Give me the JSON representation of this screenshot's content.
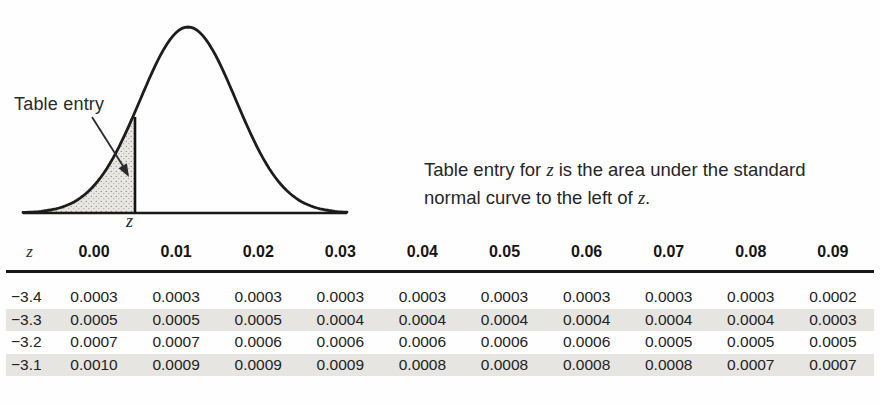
{
  "figure": {
    "annotation_label": "Table entry",
    "z_axis_label": "z"
  },
  "caption": {
    "line1": [
      "Table entry for ",
      "z",
      " is the area under the standard"
    ],
    "line2": [
      "normal curve to the left of ",
      "z",
      "."
    ]
  },
  "table": {
    "corner_header": "z",
    "column_headers": [
      "0.00",
      "0.01",
      "0.02",
      "0.03",
      "0.04",
      "0.05",
      "0.06",
      "0.07",
      "0.08",
      "0.09"
    ],
    "rows": [
      {
        "z": "−3.4",
        "shaded": false,
        "values": [
          "0.0003",
          "0.0003",
          "0.0003",
          "0.0003",
          "0.0003",
          "0.0003",
          "0.0003",
          "0.0003",
          "0.0003",
          "0.0002"
        ]
      },
      {
        "z": "−3.3",
        "shaded": true,
        "values": [
          "0.0005",
          "0.0005",
          "0.0005",
          "0.0004",
          "0.0004",
          "0.0004",
          "0.0004",
          "0.0004",
          "0.0004",
          "0.0003"
        ]
      },
      {
        "z": "−3.2",
        "shaded": false,
        "values": [
          "0.0007",
          "0.0007",
          "0.0006",
          "0.0006",
          "0.0006",
          "0.0006",
          "0.0006",
          "0.0005",
          "0.0005",
          "0.0005"
        ]
      },
      {
        "z": "−3.1",
        "shaded": true,
        "values": [
          "0.0010",
          "0.0009",
          "0.0009",
          "0.0009",
          "0.0008",
          "0.0008",
          "0.0008",
          "0.0008",
          "0.0007",
          "0.0007"
        ]
      }
    ]
  },
  "colors": {
    "row_shade": "#e6e5e1",
    "ink": "#1d1d1d",
    "tail_fill": "#e9e7e2",
    "stipple_dot": "#92908a"
  }
}
